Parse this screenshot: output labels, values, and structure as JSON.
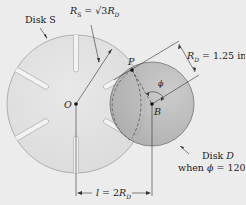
{
  "diagram": {
    "labels": {
      "disk_s": "Disk S",
      "rs_formula": "R_S = √3 R_D",
      "rs_main": "R",
      "rs_sub": "S",
      "rs_eq": " = √3",
      "rs_rd": "R",
      "rs_rd_sub": "D",
      "rd_main": "R",
      "rd_sub": "D",
      "rd_value": " = 1.25 in.",
      "point_p": "P",
      "point_o": "O",
      "point_b": "B",
      "angle_phi": "ϕ",
      "disk_d_line1_a": "Disk ",
      "disk_d_line1_b": "D",
      "disk_d_line2_a": "when ",
      "disk_d_line2_phi": "ϕ",
      "disk_d_line2_b": " = 120°",
      "distance_l": "l",
      "distance_eq": " = 2",
      "distance_r": "R",
      "distance_sub": "D"
    },
    "geometry": {
      "disk_s": {
        "center": [
          76,
          104
        ],
        "radius": 69,
        "slots": 6
      },
      "disk_d": {
        "center": [
          152,
          104
        ],
        "radius": 42,
        "phi_deg": 120
      },
      "rs_over_rd": "sqrt(3)",
      "rd_inches": 1.25,
      "center_distance": "2R_D"
    },
    "colors": {
      "background": "#ececec",
      "disk_s_fill": "#e2e2e2",
      "disk_d_fill": "#b9b9b9",
      "line": "#333333"
    }
  }
}
